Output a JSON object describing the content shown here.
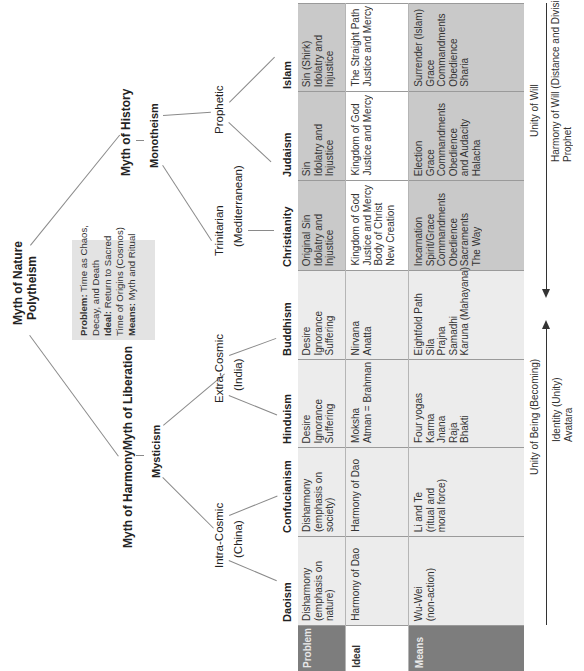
{
  "tree": {
    "root": {
      "title": "Myth of Nature",
      "subtitle": "Polytheism"
    },
    "note_box": {
      "problem_label": "Problem:",
      "problem_text_1": " Time as Chaos,",
      "problem_text_2": "Decay, and Death",
      "ideal_label": "Ideal:",
      "ideal_text_1": " Return to Sacred",
      "ideal_text_2": "Time of Origins (Cosmos)",
      "means_label": "Means:",
      "means_text": " Myth and Ritual"
    },
    "history": {
      "title": "Myth of History",
      "subtitle": "Monotheism"
    },
    "prophetic": "Prophetic",
    "trinitarian": {
      "label": "Trinitarian",
      "region": "(Mediterranean)"
    },
    "harmony": "Myth of Harmony",
    "liberation": "Myth of Liberation",
    "mysticism": "Mysticism",
    "extra_cosmic": {
      "label": "Extra-Cosmic",
      "region": "(India)"
    },
    "intra_cosmic": {
      "label": "Intra-Cosmic",
      "region": "(China)"
    }
  },
  "table": {
    "row_labels": [
      "Problem",
      "Ideal",
      "Means"
    ],
    "columns": [
      {
        "name": "Islam",
        "group": "west",
        "problem": [
          "Sin (Shirk)",
          "Idolatry and",
          "Injustice"
        ],
        "ideal": [
          "The Straight Path",
          "Justice and Mercy"
        ],
        "means": [
          "Surrender (Islam)",
          "Grace",
          "Commandments",
          "Obedience",
          "Sharia"
        ]
      },
      {
        "name": "Judaism",
        "group": "west",
        "problem": [
          "Sin",
          "Idolatry and",
          "Injustice"
        ],
        "ideal": [
          "Kingdom of God",
          "Justice and Mercy"
        ],
        "means": [
          "Election",
          "Grace",
          "Commandments",
          "Obedience",
          "and Audacity",
          "Halacha"
        ]
      },
      {
        "name": "Christianity",
        "group": "west",
        "problem": [
          "Original Sin",
          "Idolatry and",
          "Injustice"
        ],
        "ideal": [
          "Kingdom of God",
          "Justice and Mercy",
          "Body of Christ",
          "New Creation"
        ],
        "means": [
          "Incarnation",
          "Spirit/Grace",
          "Commandments",
          "Obedience",
          "Sacraments",
          "The Way"
        ]
      },
      {
        "name": "Buddhism",
        "group": "east",
        "problem": [
          "Desire",
          "Ignorance",
          "Suffering"
        ],
        "ideal": [
          "Nirvana",
          "Anatta"
        ],
        "means": [
          "Eightfold Path",
          "Sila",
          "Prajna",
          "Samadhi",
          "Karuna (Mahayana)"
        ]
      },
      {
        "name": "Hinduism",
        "group": "east",
        "problem": [
          "Desire",
          "Ignorance",
          "Suffering"
        ],
        "ideal": [
          "Moksha",
          "Atman = Brahman"
        ],
        "means": [
          "Four yogas",
          "Karma",
          "Jnana",
          "Raja",
          "Bhakti"
        ]
      },
      {
        "name": "Confucianism",
        "group": "east",
        "problem": [
          "Disharmony",
          "(emphasis on",
          "society)"
        ],
        "ideal": [
          "Harmony of Dao"
        ],
        "means": [
          "Li and Te",
          "(ritual and",
          "moral force)"
        ]
      },
      {
        "name": "Daoism",
        "group": "east",
        "problem": [
          "Disharmony",
          "(emphasis on",
          "nature)"
        ],
        "ideal": [
          "Harmony of Dao"
        ],
        "means": [
          "Wu-Wei",
          "(non-action)"
        ]
      }
    ]
  },
  "arrows": {
    "west": {
      "label": "Unity of Will",
      "line1": "Harmony of Will (Distance and Division)",
      "line2": "Prophet"
    },
    "east": {
      "label": "Unity of Being (Becoming)",
      "line1": "Identity (Unity)",
      "line2": "Avatara"
    }
  },
  "colors": {
    "row_label_dark": "#7d7d7d",
    "west_cell": "#c9c9c9",
    "east_cell": "#ececec",
    "note_box": "#e3e3e3"
  }
}
